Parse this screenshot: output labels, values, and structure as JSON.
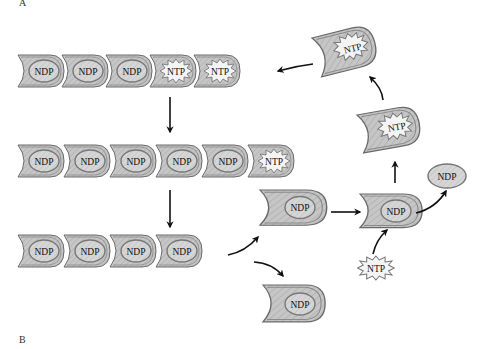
{
  "panels": {
    "a_label": "A",
    "b_label": "B"
  },
  "colors": {
    "unit_fill": "#c4c4c4",
    "unit_stroke": "#6a6a6a",
    "inner_fill": "#d8d8d8",
    "star_fill": "#f2f2f2",
    "arrow": "#111111",
    "background": "#ffffff"
  },
  "rows": [
    {
      "id": "row1",
      "units": [
        "NDP",
        "NDP",
        "NDP",
        "NTP",
        "NTP"
      ]
    },
    {
      "id": "row2",
      "units": [
        "NDP",
        "NDP",
        "NDP",
        "NDP",
        "NDP",
        "NTP"
      ]
    },
    {
      "id": "row3",
      "units": [
        "NDP",
        "NDP",
        "NDP",
        "NDP"
      ]
    }
  ],
  "free_units": {
    "top_ntp": "NTP",
    "mid_ntp": "NTP",
    "released_ndp_upper": "NDP",
    "released_ndp_lower": "NDP",
    "exchange_ndp": "NDP",
    "free_ndp": "NDP",
    "free_ntp": "NTP"
  }
}
